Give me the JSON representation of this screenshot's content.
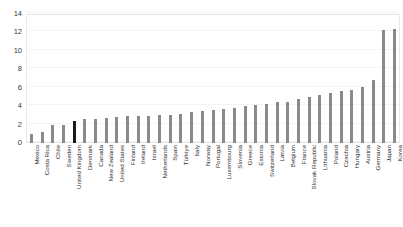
{
  "chart_data": {
    "type": "bar",
    "title": "",
    "subtitle": "",
    "xlabel": "",
    "ylabel": "",
    "ylim": [
      0,
      14
    ],
    "ytick_step": 2,
    "yticks": [
      0,
      2,
      4,
      6,
      8,
      10,
      12,
      14
    ],
    "grid": true,
    "legend": null,
    "legend_position": "none",
    "orientation": "vertical",
    "bar_color": "#8a8a8a",
    "highlight_color": "#1a1a1a",
    "highlight_category": "United Kingdom",
    "categories": [
      "Mexico",
      "Costa Rica",
      "Chile",
      "Sweden",
      "United Kingdom",
      "Denmark",
      "Canada",
      "New Zealand",
      "United States",
      "Finland",
      "Ireland",
      "Israel",
      "Netherlands",
      "Spain",
      "Türkiye",
      "Italy",
      "Norway",
      "Portugal",
      "Luxembourg",
      "Slovenia",
      "Greece",
      "Estonia",
      "Switzerland",
      "Latvia",
      "Belgium",
      "France",
      "Slovak Republic",
      "Lithuania",
      "Poland",
      "Czechia",
      "Hungary",
      "Austria",
      "Germany",
      "Japan",
      "Korea"
    ],
    "values": [
      1.0,
      1.2,
      2.0,
      2.0,
      2.4,
      2.6,
      2.6,
      2.7,
      2.8,
      2.9,
      2.9,
      2.9,
      3.0,
      3.0,
      3.2,
      3.4,
      3.5,
      3.6,
      3.7,
      3.8,
      4.0,
      4.1,
      4.2,
      4.4,
      4.5,
      4.8,
      5.0,
      5.2,
      5.4,
      5.6,
      5.8,
      6.1,
      6.8,
      12.3,
      12.4
    ]
  },
  "yticks_labels": [
    "0",
    "2",
    "4",
    "6",
    "8",
    "10",
    "12",
    "14"
  ]
}
